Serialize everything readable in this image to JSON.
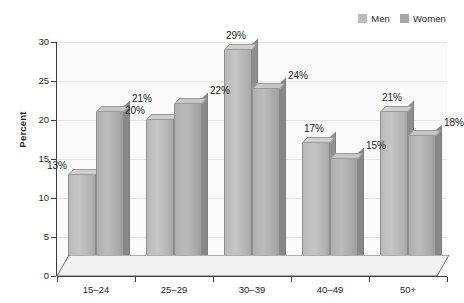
{
  "chart_data": {
    "type": "bar",
    "title": "",
    "subtitle": "",
    "xlabel": "",
    "ylabel": "Percent",
    "categories": [
      "15–24",
      "25–29",
      "30–39",
      "40–49",
      "50+"
    ],
    "series": [
      {
        "name": "Men",
        "values": [
          13,
          20,
          29,
          17,
          21
        ],
        "color": "#bdbdbd"
      },
      {
        "name": "Women",
        "values": [
          21,
          22,
          24,
          15,
          18
        ],
        "color": "#a6a6a6"
      }
    ],
    "data_labels": {
      "Men": [
        "13%",
        "20%",
        "29%",
        "17%",
        "21%"
      ],
      "Women": [
        "21%",
        "22%",
        "24%",
        "15%",
        "18%"
      ]
    },
    "ylim": [
      0,
      30
    ],
    "yticks": [
      0,
      5,
      10,
      15,
      20,
      25,
      30
    ],
    "ytick_labels": [
      "0",
      "5",
      "10",
      "15",
      "20",
      "25",
      "30"
    ],
    "grid": true,
    "legend_position": "top-right",
    "style": "3d-column"
  },
  "legend": {
    "entries": [
      {
        "label": "Men"
      },
      {
        "label": "Women"
      }
    ]
  }
}
